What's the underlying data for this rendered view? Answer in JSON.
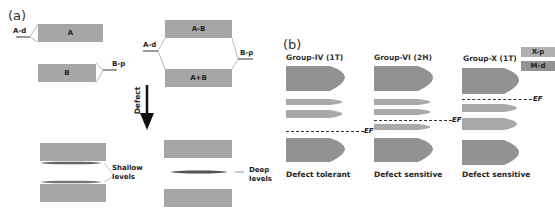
{
  "panel_a": {
    "label": "(a)",
    "before": {
      "left": {
        "bands": [
          {
            "label": "A"
          },
          {
            "label": "B"
          }
        ],
        "levels": [
          {
            "label": "A-d",
            "italic_part": "d"
          },
          {
            "label": "B-p",
            "italic_part": "p"
          }
        ]
      },
      "right": {
        "bands": [
          {
            "label": "A-B"
          },
          {
            "label": "A+B"
          }
        ],
        "levels": [
          {
            "label": "A-d"
          },
          {
            "label": "B-p"
          }
        ]
      }
    },
    "arrow": {
      "label": "Defect"
    },
    "after": {
      "left": {
        "annotation": "Shallow levels",
        "annotation_lines": [
          "Shallow",
          "levels"
        ]
      },
      "right": {
        "annotation": "Deep levels",
        "annotation_lines": [
          "Deep",
          "levels"
        ]
      }
    }
  },
  "panel_b": {
    "label": "(b)",
    "legend": [
      {
        "label": "X-p",
        "color": "#a8a8a8"
      },
      {
        "label": "M-d",
        "color": "#8f8f8f"
      }
    ],
    "groups": [
      {
        "title": "Group-IV (1T)",
        "fermi_label": "EF",
        "caption": "Defect tolerant"
      },
      {
        "title": "Group-VI (2H)",
        "fermi_label": "EF",
        "caption": "Defect sensitive"
      },
      {
        "title": "Group-X (1T)",
        "fermi_label": "EF",
        "caption": "Defect sensitive"
      }
    ]
  },
  "colors": {
    "band_gray": "#a6a6a6",
    "md_dark": "#8f8f8f",
    "xp_light": "#a8a8a8",
    "text": "#222222"
  }
}
